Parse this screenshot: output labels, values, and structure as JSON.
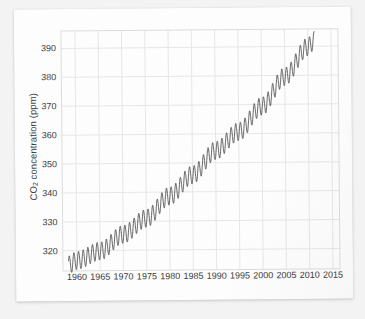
{
  "figure": {
    "paper_background": "#fdfdfd",
    "page_background": "#f3f3f3",
    "line_color": "#4a4a4a",
    "grid_color": "#e6e6e6",
    "border_color": "#dcdcdc",
    "text_color": "#3b3b3b"
  },
  "chart_data": {
    "type": "line",
    "title": "",
    "xlabel": "",
    "ylabel": "CO2 concentration (ppm)",
    "ylabel_html": "CO<sub>2</sub> concentration (ppm)",
    "xlim": [
      1957.0,
      2016.5
    ],
    "ylim": [
      313.0,
      396.0
    ],
    "grid": true,
    "legend": null,
    "xticks": [
      1960,
      1965,
      1970,
      1975,
      1980,
      1985,
      1990,
      1995,
      2000,
      2005,
      2010,
      2015
    ],
    "yticks": [
      320,
      330,
      340,
      350,
      360,
      370,
      380,
      390
    ],
    "xtick_labels": [
      "1960",
      "1965",
      "1970",
      "1975",
      "1980",
      "1985",
      "1990",
      "1995",
      "2000",
      "2005",
      "2010",
      "2015"
    ],
    "ytick_labels": [
      "320",
      "330",
      "340",
      "350",
      "360",
      "370",
      "380",
      "390"
    ],
    "series": [
      {
        "name": "Monthly mean CO2 (Mauna Loa)",
        "description": "Keeling curve: rising annual-mean trend with ~6 ppm seasonal sawtooth oscillation",
        "x_start": 1958.2,
        "x_end": 2011.4,
        "samples_per_year": 12,
        "seasonal_amplitude_ppm": 3.1,
        "seasonal_peak_month_fraction": 0.37,
        "trend_anchors": [
          {
            "year": 1958,
            "ppm": 315.0
          },
          {
            "year": 1960,
            "ppm": 316.6
          },
          {
            "year": 1965,
            "ppm": 319.8
          },
          {
            "year": 1970,
            "ppm": 325.5
          },
          {
            "year": 1975,
            "ppm": 331.0
          },
          {
            "year": 1980,
            "ppm": 338.6
          },
          {
            "year": 1985,
            "ppm": 345.9
          },
          {
            "year": 1990,
            "ppm": 354.2
          },
          {
            "year": 1995,
            "ppm": 360.7
          },
          {
            "year": 2000,
            "ppm": 369.4
          },
          {
            "year": 2005,
            "ppm": 379.6
          },
          {
            "year": 2010,
            "ppm": 389.8
          },
          {
            "year": 2011.4,
            "ppm": 392.0
          }
        ],
        "annual_min_ppm": 313.2,
        "annual_max_ppm": 393.8
      }
    ]
  }
}
